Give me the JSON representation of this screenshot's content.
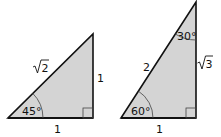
{
  "diagram": {
    "fill_color": "#d4d4d4",
    "stroke_color": "#111111",
    "triangles": [
      {
        "name": "45-45-90 triangle",
        "angle": "45°",
        "hypotenuse": "√2",
        "vertical_leg": "1",
        "horizontal_leg": "1",
        "hyp_radicand": "2"
      },
      {
        "name": "30-60-90 triangle",
        "top_angle": "30°",
        "bottom_angle": "60°",
        "hypotenuse": "2",
        "vertical_leg": "√3",
        "vertical_radicand": "3",
        "horizontal_leg": "1"
      }
    ]
  }
}
